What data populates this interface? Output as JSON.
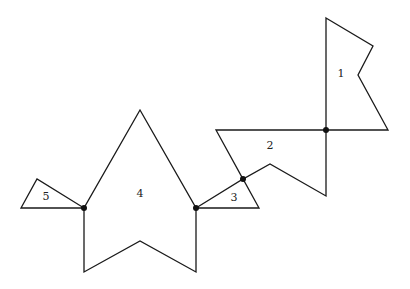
{
  "diagram": {
    "type": "polygon-chain",
    "stroke_color": "#1a1a1a",
    "background": "#ffffff",
    "polygons": [
      {
        "id": 1,
        "label": "1",
        "points": "326,18 373,46 358,75 388,130 326,130",
        "label_pos": [
          341,
          74
        ]
      },
      {
        "id": 2,
        "label": "2",
        "points": "216,130 326,130 326,196 270,164 243,179",
        "label_pos": [
          270,
          146
        ]
      },
      {
        "id": 3,
        "label": "3",
        "points": "196,208 243,179 259,208",
        "label_pos": [
          234,
          198
        ]
      },
      {
        "id": 4,
        "label": "4",
        "points": "140,110 196,208 196,272 140,241 84,272 84,208",
        "label_pos": [
          140,
          194
        ]
      },
      {
        "id": 5,
        "label": "5",
        "points": "21,208 37,179 84,208",
        "label_pos": [
          46,
          197
        ]
      }
    ],
    "junctions": [
      {
        "between": "1-2",
        "x": 326,
        "y": 130
      },
      {
        "between": "2-3",
        "x": 243,
        "y": 179
      },
      {
        "between": "3-4",
        "x": 196,
        "y": 208
      },
      {
        "between": "4-5",
        "x": 84,
        "y": 208
      }
    ]
  }
}
